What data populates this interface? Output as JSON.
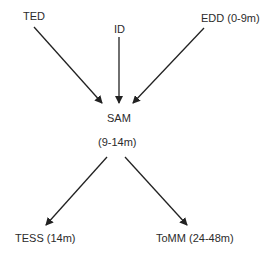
{
  "diagram": {
    "type": "flow",
    "nodes": {
      "ted": {
        "label": "TED"
      },
      "id": {
        "label": "ID"
      },
      "edd": {
        "label": "EDD (0-9m)"
      },
      "sam": {
        "label": "SAM"
      },
      "sam_age": {
        "label": "(9-14m)"
      },
      "tess": {
        "label": "TESS (14m)"
      },
      "tomm": {
        "label": "ToMM (24-48m)"
      }
    },
    "edges": [
      {
        "from": "TED",
        "to": "SAM"
      },
      {
        "from": "ID",
        "to": "SAM"
      },
      {
        "from": "EDD (0-9m)",
        "to": "SAM"
      },
      {
        "from": "SAM",
        "to": "TESS (14m)"
      },
      {
        "from": "SAM",
        "to": "ToMM (24-48m)"
      }
    ],
    "colors": {
      "text": "#2b2b2b",
      "arrow": "#222222",
      "background": "#ffffff"
    }
  }
}
